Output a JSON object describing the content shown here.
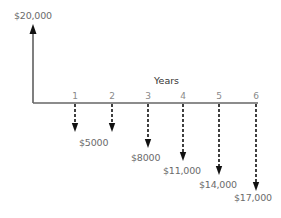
{
  "diagram": {
    "type": "cash-flow-diagram",
    "inflow": {
      "label": "$20,000",
      "year": 0,
      "direction": "up"
    },
    "axis_label": "Years",
    "ticks": [
      "1",
      "2",
      "3",
      "4",
      "5",
      "6"
    ],
    "outflows": [
      {
        "year": "1",
        "amount": 5000,
        "label": ""
      },
      {
        "year": "2",
        "amount": 5000,
        "label": "$5000"
      },
      {
        "year": "3",
        "amount": 8000,
        "label": "$8000"
      },
      {
        "year": "4",
        "amount": 11000,
        "label": "$11,000"
      },
      {
        "year": "5",
        "amount": 14000,
        "label": "$14,000"
      },
      {
        "year": "6",
        "amount": 17000,
        "label": "$17,000"
      }
    ],
    "colors": {
      "axis": "#555555",
      "arrow": "#111111",
      "text": "#6b6b6b"
    }
  }
}
